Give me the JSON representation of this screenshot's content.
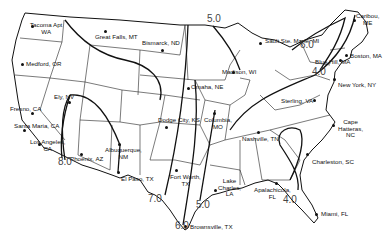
{
  "map": {
    "region": "Contiguous United States",
    "contour_values": [
      "5.0",
      "6.0",
      "4.0",
      "8.0",
      "7.0",
      "6.0",
      "5.0",
      "4.0"
    ],
    "contour_labels": [
      {
        "text": "5.0",
        "x": 207,
        "y": 21
      },
      {
        "text": "6.0",
        "x": 300,
        "y": 47
      },
      {
        "text": "4.0",
        "x": 312,
        "y": 74
      },
      {
        "text": "8.0",
        "x": 58,
        "y": 164
      },
      {
        "text": "7.0",
        "x": 148,
        "y": 201
      },
      {
        "text": "6.0",
        "x": 175,
        "y": 228
      },
      {
        "text": "5.0",
        "x": 196,
        "y": 207
      },
      {
        "text": "4.0",
        "x": 283,
        "y": 202
      }
    ],
    "cities": [
      {
        "label": "Tacoma Apt\nWA",
        "x": 32,
        "y": 26,
        "lx": 30,
        "ly": 22
      },
      {
        "label": "Great Falls, MT",
        "x": 105,
        "y": 31,
        "lx": 95,
        "ly": 34
      },
      {
        "label": "Bismarck, ND",
        "x": 162,
        "y": 50,
        "lx": 142,
        "ly": 40
      },
      {
        "label": "Medford, OR",
        "x": 22,
        "y": 64,
        "lx": 26,
        "ly": 61
      },
      {
        "label": "Ely, NV",
        "x": 69,
        "y": 102,
        "lx": 54,
        "ly": 94
      },
      {
        "label": "Fresno, CA",
        "x": 32,
        "y": 113,
        "lx": 10,
        "ly": 106
      },
      {
        "label": "Santa Maria, CA",
        "x": 24,
        "y": 130,
        "lx": 14,
        "ly": 123
      },
      {
        "label": "Los Angeles,\nCA",
        "x": 39,
        "y": 144,
        "lx": 30,
        "ly": 139
      },
      {
        "label": "Phoenix, AZ",
        "x": 81,
        "y": 154,
        "lx": 70,
        "ly": 156
      },
      {
        "label": "Albuquerque,\nNM",
        "x": 119,
        "y": 144,
        "lx": 105,
        "ly": 147
      },
      {
        "label": "El Paso, TX",
        "x": 118,
        "y": 172,
        "lx": 121,
        "ly": 176
      },
      {
        "label": "Omaha, NE",
        "x": 188,
        "y": 88,
        "lx": 191,
        "ly": 84
      },
      {
        "label": "Dodge City, KS",
        "x": 166,
        "y": 127,
        "lx": 158,
        "ly": 117
      },
      {
        "label": "Columbia,\nMO",
        "x": 214,
        "y": 113,
        "lx": 204,
        "ly": 117
      },
      {
        "label": "Madison, WI",
        "x": 233,
        "y": 72,
        "lx": 222,
        "ly": 69
      },
      {
        "label": "Sault Ste. Marie, MI",
        "x": 260,
        "y": 43,
        "lx": 265,
        "ly": 38
      },
      {
        "label": "Caribou,\nME",
        "x": 354,
        "y": 20,
        "lx": 356,
        "ly": 13
      },
      {
        "label": "Boston, MA",
        "x": 346,
        "y": 55,
        "lx": 350,
        "ly": 53
      },
      {
        "label": "Blue Hill, MA",
        "x": 340,
        "y": 60,
        "lx": 315,
        "ly": 59
      },
      {
        "label": "New York, NY",
        "x": 334,
        "y": 79,
        "lx": 338,
        "ly": 82
      },
      {
        "label": "Sterling, VA",
        "x": 314,
        "y": 100,
        "lx": 281,
        "ly": 98
      },
      {
        "label": "Nashville, TN",
        "x": 258,
        "y": 132,
        "lx": 242,
        "ly": 136
      },
      {
        "label": "Cape\nHatteras,\nNC",
        "x": 333,
        "y": 125,
        "lx": 338,
        "ly": 119
      },
      {
        "label": "Charleston, SC",
        "x": 307,
        "y": 154,
        "lx": 312,
        "ly": 159
      },
      {
        "label": "Lake\nCharles,\nLA",
        "x": 215,
        "y": 190,
        "lx": 218,
        "ly": 178
      },
      {
        "label": "Fort Worth,\nTX",
        "x": 176,
        "y": 170,
        "lx": 170,
        "ly": 174
      },
      {
        "label": "Apalachicola,\nFL",
        "x": 276,
        "y": 183,
        "lx": 254,
        "ly": 187
      },
      {
        "label": "Miami, FL",
        "x": 316,
        "y": 214,
        "lx": 321,
        "ly": 211
      },
      {
        "label": "Brownsville, TX",
        "x": 185,
        "y": 226,
        "lx": 190,
        "ly": 224
      }
    ]
  }
}
